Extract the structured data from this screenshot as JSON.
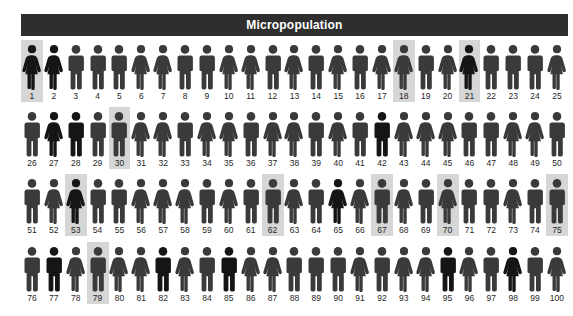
{
  "title": {
    "text": "Micropopulation"
  },
  "colors": {
    "title_bar_bg": "#2e2e2e",
    "title_text": "#ffffff",
    "figure_normal": "#3a3a3a",
    "figure_dark": "#151515",
    "highlight_bg": "#d6d6d6",
    "label_text": "#1f1f1f",
    "page_bg": "#ffffff"
  },
  "legend": {
    "male_icon": "male-figure-icon",
    "female_icon": "female-figure-icon",
    "highlight_meaning": "sampled-individual"
  },
  "chart_data": {
    "type": "pictogram",
    "title": "Micropopulation",
    "total_units": 100,
    "rows": 4,
    "columns": 25,
    "xlabel": "",
    "ylabel": "",
    "legend_position": "none",
    "grid": false,
    "categories": [
      "male",
      "female"
    ],
    "counts": {
      "male": 53,
      "female": 47
    },
    "highlighted_ids": [
      1,
      18,
      21,
      30,
      53,
      62,
      67,
      70,
      75,
      79
    ],
    "highlighted_count": 10,
    "units": [
      {
        "id": 1,
        "sex": "female",
        "highlighted": true,
        "shade": "dark"
      },
      {
        "id": 2,
        "sex": "female",
        "highlighted": false,
        "shade": "dark"
      },
      {
        "id": 3,
        "sex": "male",
        "highlighted": false,
        "shade": "normal"
      },
      {
        "id": 4,
        "sex": "male",
        "highlighted": false,
        "shade": "normal"
      },
      {
        "id": 5,
        "sex": "male",
        "highlighted": false,
        "shade": "normal"
      },
      {
        "id": 6,
        "sex": "female",
        "highlighted": false,
        "shade": "normal"
      },
      {
        "id": 7,
        "sex": "female",
        "highlighted": false,
        "shade": "normal"
      },
      {
        "id": 8,
        "sex": "male",
        "highlighted": false,
        "shade": "normal"
      },
      {
        "id": 9,
        "sex": "male",
        "highlighted": false,
        "shade": "normal"
      },
      {
        "id": 10,
        "sex": "female",
        "highlighted": false,
        "shade": "normal"
      },
      {
        "id": 11,
        "sex": "female",
        "highlighted": false,
        "shade": "normal"
      },
      {
        "id": 12,
        "sex": "male",
        "highlighted": false,
        "shade": "normal"
      },
      {
        "id": 13,
        "sex": "female",
        "highlighted": false,
        "shade": "normal"
      },
      {
        "id": 14,
        "sex": "male",
        "highlighted": false,
        "shade": "normal"
      },
      {
        "id": 15,
        "sex": "female",
        "highlighted": false,
        "shade": "normal"
      },
      {
        "id": 16,
        "sex": "male",
        "highlighted": false,
        "shade": "normal"
      },
      {
        "id": 17,
        "sex": "female",
        "highlighted": false,
        "shade": "normal"
      },
      {
        "id": 18,
        "sex": "female",
        "highlighted": true,
        "shade": "normal"
      },
      {
        "id": 19,
        "sex": "male",
        "highlighted": false,
        "shade": "normal"
      },
      {
        "id": 20,
        "sex": "female",
        "highlighted": false,
        "shade": "normal"
      },
      {
        "id": 21,
        "sex": "female",
        "highlighted": true,
        "shade": "dark"
      },
      {
        "id": 22,
        "sex": "male",
        "highlighted": false,
        "shade": "normal"
      },
      {
        "id": 23,
        "sex": "male",
        "highlighted": false,
        "shade": "normal"
      },
      {
        "id": 24,
        "sex": "male",
        "highlighted": false,
        "shade": "normal"
      },
      {
        "id": 25,
        "sex": "female",
        "highlighted": false,
        "shade": "normal"
      },
      {
        "id": 26,
        "sex": "male",
        "highlighted": false,
        "shade": "normal"
      },
      {
        "id": 27,
        "sex": "female",
        "highlighted": false,
        "shade": "dark"
      },
      {
        "id": 28,
        "sex": "male",
        "highlighted": false,
        "shade": "dark"
      },
      {
        "id": 29,
        "sex": "male",
        "highlighted": false,
        "shade": "normal"
      },
      {
        "id": 30,
        "sex": "male",
        "highlighted": true,
        "shade": "normal"
      },
      {
        "id": 31,
        "sex": "female",
        "highlighted": false,
        "shade": "normal"
      },
      {
        "id": 32,
        "sex": "female",
        "highlighted": false,
        "shade": "normal"
      },
      {
        "id": 33,
        "sex": "male",
        "highlighted": false,
        "shade": "normal"
      },
      {
        "id": 34,
        "sex": "female",
        "highlighted": false,
        "shade": "normal"
      },
      {
        "id": 35,
        "sex": "female",
        "highlighted": false,
        "shade": "normal"
      },
      {
        "id": 36,
        "sex": "male",
        "highlighted": false,
        "shade": "normal"
      },
      {
        "id": 37,
        "sex": "female",
        "highlighted": false,
        "shade": "normal"
      },
      {
        "id": 38,
        "sex": "female",
        "highlighted": false,
        "shade": "normal"
      },
      {
        "id": 39,
        "sex": "male",
        "highlighted": false,
        "shade": "normal"
      },
      {
        "id": 40,
        "sex": "female",
        "highlighted": false,
        "shade": "normal"
      },
      {
        "id": 41,
        "sex": "male",
        "highlighted": false,
        "shade": "normal"
      },
      {
        "id": 42,
        "sex": "male",
        "highlighted": false,
        "shade": "dark"
      },
      {
        "id": 43,
        "sex": "female",
        "highlighted": false,
        "shade": "normal"
      },
      {
        "id": 44,
        "sex": "female",
        "highlighted": false,
        "shade": "normal"
      },
      {
        "id": 45,
        "sex": "female",
        "highlighted": false,
        "shade": "normal"
      },
      {
        "id": 46,
        "sex": "male",
        "highlighted": false,
        "shade": "normal"
      },
      {
        "id": 47,
        "sex": "male",
        "highlighted": false,
        "shade": "normal"
      },
      {
        "id": 48,
        "sex": "female",
        "highlighted": false,
        "shade": "normal"
      },
      {
        "id": 49,
        "sex": "female",
        "highlighted": false,
        "shade": "normal"
      },
      {
        "id": 50,
        "sex": "male",
        "highlighted": false,
        "shade": "normal"
      },
      {
        "id": 51,
        "sex": "male",
        "highlighted": false,
        "shade": "normal"
      },
      {
        "id": 52,
        "sex": "female",
        "highlighted": false,
        "shade": "normal"
      },
      {
        "id": 53,
        "sex": "female",
        "highlighted": true,
        "shade": "dark"
      },
      {
        "id": 54,
        "sex": "male",
        "highlighted": false,
        "shade": "normal"
      },
      {
        "id": 55,
        "sex": "male",
        "highlighted": false,
        "shade": "normal"
      },
      {
        "id": 56,
        "sex": "female",
        "highlighted": false,
        "shade": "normal"
      },
      {
        "id": 57,
        "sex": "female",
        "highlighted": false,
        "shade": "normal"
      },
      {
        "id": 58,
        "sex": "female",
        "highlighted": false,
        "shade": "normal"
      },
      {
        "id": 59,
        "sex": "male",
        "highlighted": false,
        "shade": "normal"
      },
      {
        "id": 60,
        "sex": "female",
        "highlighted": false,
        "shade": "normal"
      },
      {
        "id": 61,
        "sex": "male",
        "highlighted": false,
        "shade": "normal"
      },
      {
        "id": 62,
        "sex": "male",
        "highlighted": true,
        "shade": "normal"
      },
      {
        "id": 63,
        "sex": "female",
        "highlighted": false,
        "shade": "normal"
      },
      {
        "id": 64,
        "sex": "male",
        "highlighted": false,
        "shade": "normal"
      },
      {
        "id": 65,
        "sex": "female",
        "highlighted": false,
        "shade": "dark"
      },
      {
        "id": 66,
        "sex": "female",
        "highlighted": false,
        "shade": "normal"
      },
      {
        "id": 67,
        "sex": "male",
        "highlighted": true,
        "shade": "normal"
      },
      {
        "id": 68,
        "sex": "female",
        "highlighted": false,
        "shade": "normal"
      },
      {
        "id": 69,
        "sex": "male",
        "highlighted": false,
        "shade": "normal"
      },
      {
        "id": 70,
        "sex": "female",
        "highlighted": true,
        "shade": "normal"
      },
      {
        "id": 71,
        "sex": "male",
        "highlighted": false,
        "shade": "normal"
      },
      {
        "id": 72,
        "sex": "male",
        "highlighted": false,
        "shade": "normal"
      },
      {
        "id": 73,
        "sex": "female",
        "highlighted": false,
        "shade": "normal"
      },
      {
        "id": 74,
        "sex": "male",
        "highlighted": false,
        "shade": "normal"
      },
      {
        "id": 75,
        "sex": "male",
        "highlighted": true,
        "shade": "normal"
      },
      {
        "id": 76,
        "sex": "male",
        "highlighted": false,
        "shade": "normal"
      },
      {
        "id": 77,
        "sex": "male",
        "highlighted": false,
        "shade": "dark"
      },
      {
        "id": 78,
        "sex": "female",
        "highlighted": false,
        "shade": "normal"
      },
      {
        "id": 79,
        "sex": "male",
        "highlighted": true,
        "shade": "normal"
      },
      {
        "id": 80,
        "sex": "female",
        "highlighted": false,
        "shade": "normal"
      },
      {
        "id": 81,
        "sex": "female",
        "highlighted": false,
        "shade": "normal"
      },
      {
        "id": 82,
        "sex": "male",
        "highlighted": false,
        "shade": "dark"
      },
      {
        "id": 83,
        "sex": "female",
        "highlighted": false,
        "shade": "normal"
      },
      {
        "id": 84,
        "sex": "male",
        "highlighted": false,
        "shade": "normal"
      },
      {
        "id": 85,
        "sex": "male",
        "highlighted": false,
        "shade": "dark"
      },
      {
        "id": 86,
        "sex": "female",
        "highlighted": false,
        "shade": "normal"
      },
      {
        "id": 87,
        "sex": "female",
        "highlighted": false,
        "shade": "normal"
      },
      {
        "id": 88,
        "sex": "male",
        "highlighted": false,
        "shade": "normal"
      },
      {
        "id": 89,
        "sex": "male",
        "highlighted": false,
        "shade": "normal"
      },
      {
        "id": 90,
        "sex": "male",
        "highlighted": false,
        "shade": "normal"
      },
      {
        "id": 91,
        "sex": "female",
        "highlighted": false,
        "shade": "normal"
      },
      {
        "id": 92,
        "sex": "male",
        "highlighted": false,
        "shade": "normal"
      },
      {
        "id": 93,
        "sex": "female",
        "highlighted": false,
        "shade": "normal"
      },
      {
        "id": 94,
        "sex": "female",
        "highlighted": false,
        "shade": "normal"
      },
      {
        "id": 95,
        "sex": "male",
        "highlighted": false,
        "shade": "dark"
      },
      {
        "id": 96,
        "sex": "female",
        "highlighted": false,
        "shade": "normal"
      },
      {
        "id": 97,
        "sex": "male",
        "highlighted": false,
        "shade": "normal"
      },
      {
        "id": 98,
        "sex": "female",
        "highlighted": false,
        "shade": "dark"
      },
      {
        "id": 99,
        "sex": "male",
        "highlighted": false,
        "shade": "normal"
      },
      {
        "id": 100,
        "sex": "female",
        "highlighted": false,
        "shade": "normal"
      }
    ]
  }
}
